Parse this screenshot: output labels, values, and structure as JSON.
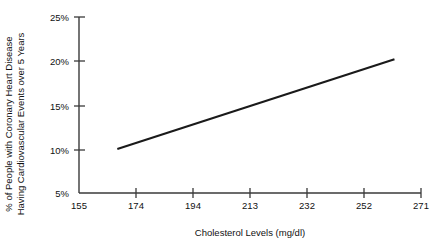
{
  "chart_data": {
    "type": "line",
    "title": "",
    "xlabel": "Cholesterol Levels (mg/dl)",
    "ylabel_line1": "% of People with Coronary Heart Disease",
    "ylabel_line2": "Having Cardiovascular Events over 5 Years",
    "x_ticks": [
      155,
      174,
      194,
      213,
      232,
      252,
      271
    ],
    "x_tick_labels": [
      "155",
      "174",
      "194",
      "213",
      "232",
      "252",
      "271"
    ],
    "y_ticks": [
      5,
      10,
      15,
      20,
      25
    ],
    "y_tick_labels": [
      "5%",
      "10%",
      "15%",
      "20%",
      "25%"
    ],
    "xlim": [
      155,
      271
    ],
    "ylim": [
      5,
      25
    ],
    "grid": false,
    "legend": "none",
    "series": [
      {
        "name": "Cardiovascular event rate",
        "x": [
          168,
          262
        ],
        "values": [
          10.0,
          20.2
        ],
        "color": "#1a1a1a"
      }
    ],
    "colors": {
      "line": "#1a1a1a",
      "axis": "#3a3a3a",
      "text": "#111111",
      "background": "#ffffff"
    }
  }
}
